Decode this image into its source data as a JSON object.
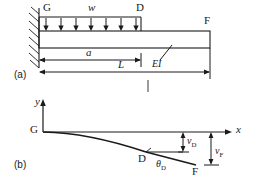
{
  "figure": {
    "type": "engineering-beam-deflection-diagram",
    "ink_color": "#1a1a1a",
    "background": "#ffffff",
    "panels": [
      {
        "tag": "(a)",
        "name": "loaded-cantilever-beam",
        "description": "Cantilever beam fixed at left wall, uniformly distributed load over part of span"
      },
      {
        "tag": "(b)",
        "name": "deflection-curve",
        "description": "Elastic curve of the deflected beam with x-y axes"
      }
    ]
  },
  "panel_a": {
    "tag": "(a)",
    "support_label": "G",
    "load_label": "w",
    "load_end_label": "D",
    "free_end_label": "F",
    "stiffness_label": "EI",
    "dim_a": "a",
    "dim_L": "L",
    "load_arrow_count": 7
  },
  "panel_b": {
    "tag": "(b)",
    "axis_y": "y",
    "axis_x": "x",
    "origin_label": "G",
    "point_d_label": "D",
    "point_f_label": "F",
    "deflection_d": "v",
    "deflection_d_sub": "D",
    "deflection_f": "v",
    "deflection_f_sub": "F",
    "slope_label": "θ",
    "slope_sub": "D"
  }
}
